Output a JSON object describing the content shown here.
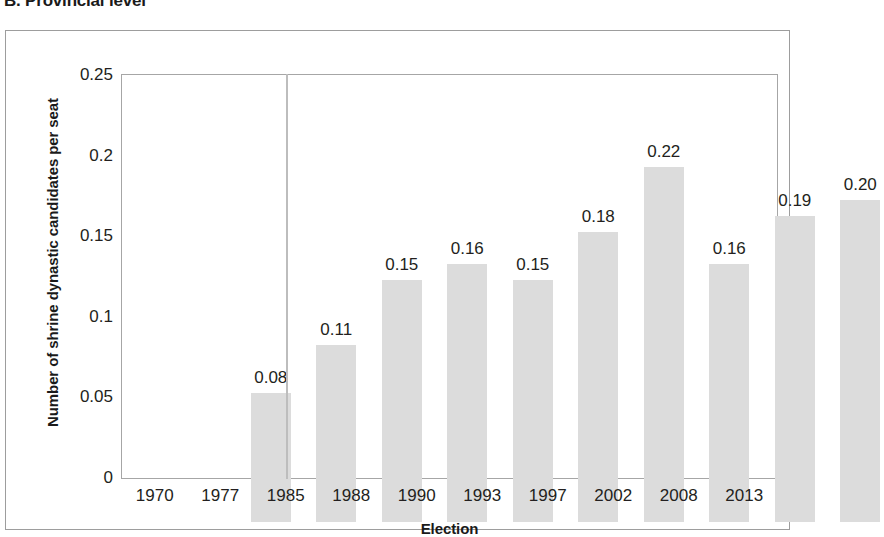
{
  "figure": {
    "title": "B. Provincial level"
  },
  "chart_data": {
    "type": "bar",
    "title": "B. Provincial level",
    "xlabel": "Election",
    "ylabel": "Number of shrine dynastic candidates per seat",
    "categories": [
      "1970",
      "1977",
      "1985",
      "1988",
      "1990",
      "1993",
      "1997",
      "2002",
      "2008",
      "2013"
    ],
    "values": [
      0.08,
      0.11,
      0.15,
      0.16,
      0.15,
      0.18,
      0.22,
      0.16,
      0.19,
      0.2
    ],
    "data_labels": [
      "0.08",
      "0.11",
      "0.15",
      "0.16",
      "0.15",
      "0.18",
      "0.22",
      "0.16",
      "0.19",
      "0.20"
    ],
    "ylim": [
      0,
      0.25
    ],
    "y_ticks": [
      {
        "value": 0.25,
        "label": "0.25"
      },
      {
        "value": 0.2,
        "label": "0.2"
      },
      {
        "value": 0.15,
        "label": "0.15"
      },
      {
        "value": 0.1,
        "label": "0.1"
      },
      {
        "value": 0.05,
        "label": "0.05"
      },
      {
        "value": 0,
        "label": "0"
      }
    ],
    "grid": false,
    "legend": false,
    "bar_color": "#dcdcdc",
    "annotations": [
      {
        "kind": "vertical-line",
        "at_category": "1985",
        "color": "#bdbdbd"
      }
    ]
  }
}
